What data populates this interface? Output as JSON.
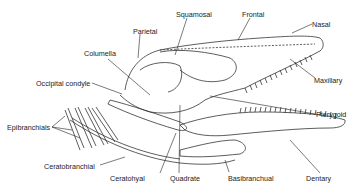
{
  "diagram": {
    "labels": {
      "squamosal": "Squamosal",
      "frontal": "Frontal",
      "nasal": "Nasal",
      "parietal": "Parietal",
      "columella": "Columella",
      "maxillary": "Maxillary",
      "occipital_condyle": "Occipital condyle",
      "pterygoid": "Pterygoid",
      "epibranchials": "Epibranchials",
      "ceratobranchial": "Ceratobranchial",
      "ceratohyal": "Ceratohyal",
      "quadrate": "Quadrate",
      "basibranchial": "Basibranchual",
      "dentary": "Dentary"
    }
  }
}
